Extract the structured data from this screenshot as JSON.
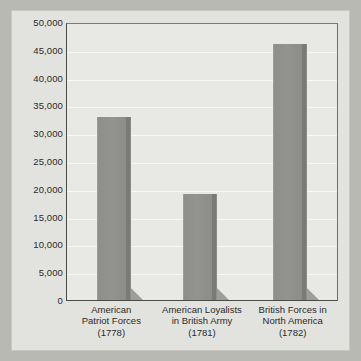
{
  "chart_data": {
    "type": "bar",
    "title": "",
    "subtitle": "",
    "xlabel": "",
    "ylabel": "",
    "categories": [
      "American Patriot Forces (1778)",
      "American Loyalists in British Army (1781)",
      "British Forces in North America (1782)"
    ],
    "category_lines": [
      [
        "American",
        "Patriot Forces",
        "(1778)"
      ],
      [
        "American Loyalists",
        "in British Army",
        "(1781)"
      ],
      [
        "British Forces in",
        "North America",
        "(1782)"
      ]
    ],
    "values": [
      33000,
      19000,
      46000
    ],
    "ylim": [
      0,
      50000
    ],
    "ytick_values": [
      0,
      5000,
      10000,
      15000,
      20000,
      25000,
      30000,
      35000,
      40000,
      45000,
      50000
    ],
    "ytick_labels": [
      "0",
      "5,000",
      "10,000",
      "15,000",
      "20,000",
      "25,000",
      "30,000",
      "35,000",
      "40,000",
      "45,000",
      "50,000"
    ],
    "grid": true,
    "grid_orientation": "horizontal",
    "legend": false,
    "legend_position": "none",
    "bar_color": "#90908d",
    "plot_background": "#e8e8e5",
    "panel_background": "#e2e2de",
    "page_background": "#b9b9b4",
    "gridline_color": "#f7f7f5",
    "axis_color": "#4a4a48",
    "text_color": "#2b2b2b"
  }
}
